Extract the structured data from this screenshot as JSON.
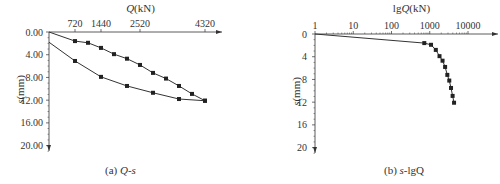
{
  "chart_data": [
    {
      "type": "line",
      "panel": "a",
      "caption_prefix": "(a) ",
      "caption_italic": "Q-s",
      "caption_suffix": "",
      "title": "",
      "xlabel_italic": "Q",
      "xlabel_rest": "(kN)",
      "ylabel_italic": "s",
      "ylabel_rest": "(mm)",
      "x_axis_position": "top",
      "y_inverted": true,
      "xticks": [
        720,
        1440,
        2520,
        4320
      ],
      "xtick_labels": [
        "720",
        "1440",
        "2520",
        "4320"
      ],
      "yticks": [
        0,
        4,
        8,
        12,
        16,
        20
      ],
      "ytick_labels": [
        "0.00",
        "4.00",
        "8.00",
        "12.00",
        "16.00",
        "20.00"
      ],
      "xlim": [
        0,
        4320
      ],
      "ylim": [
        0,
        22
      ],
      "grid": false,
      "marker": "square",
      "series": [
        {
          "name": "loading",
          "x": [
            0,
            720,
            1080,
            1440,
            1800,
            2160,
            2520,
            2880,
            3240,
            3600,
            3960,
            4320
          ],
          "y": [
            0.0,
            1.6,
            1.9,
            2.8,
            3.9,
            4.7,
            5.8,
            7.2,
            8.2,
            9.5,
            10.9,
            12.1
          ],
          "markers_from_index": 1
        },
        {
          "name": "unloading",
          "x": [
            0,
            720,
            1440,
            2160,
            2880,
            3600,
            4320
          ],
          "y": [
            1.8,
            5.1,
            7.9,
            9.5,
            10.7,
            11.8,
            12.1
          ],
          "markers_from_index": 1
        }
      ]
    },
    {
      "type": "line",
      "panel": "b",
      "caption_prefix": "(b) ",
      "caption_italic": "s",
      "caption_suffix": "-lgQ",
      "title": "",
      "xlabel_italic": "Q",
      "xlabel_prefix": "lg",
      "xlabel_rest": "(kN)",
      "ylabel_italic": "s",
      "ylabel_rest": "(mm)",
      "x_axis_position": "top",
      "x_scale": "log",
      "y_inverted": true,
      "xticks": [
        1,
        10,
        100,
        1000,
        10000
      ],
      "xtick_labels": [
        "1",
        "10",
        "100",
        "1000",
        "10000"
      ],
      "yticks": [
        0,
        4,
        8,
        12,
        16,
        20
      ],
      "ytick_labels": [
        "0",
        "4",
        "8",
        "12",
        "16",
        "20"
      ],
      "xlim": [
        1,
        10000
      ],
      "ylim": [
        0,
        22
      ],
      "grid": false,
      "marker": "square",
      "series": [
        {
          "name": "loading",
          "x": [
            1,
            720,
            1080,
            1440,
            1800,
            2160,
            2520,
            2880,
            3240,
            3600,
            3960,
            4320
          ],
          "y": [
            0.0,
            1.6,
            1.9,
            2.8,
            3.9,
            4.7,
            5.8,
            7.2,
            8.2,
            9.5,
            10.9,
            12.1
          ],
          "markers_from_index": 1
        }
      ]
    }
  ],
  "colors": {
    "line": "#333333",
    "marker": "#222222",
    "text": "#333333"
  }
}
